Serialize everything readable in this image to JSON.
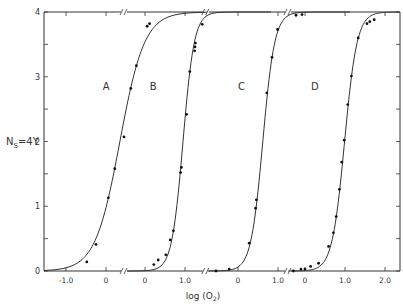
{
  "chart_data": {
    "type": "scatter",
    "title": "",
    "xlabel": "log (O2)",
    "ylabel": "Ns=4Y",
    "ylim": [
      0,
      4
    ],
    "yticks": [
      0,
      1,
      2,
      3,
      4
    ],
    "grid": false,
    "legend": "curve letters annotated on plot",
    "axis_breaks": true,
    "panels": [
      {
        "name": "A",
        "x_zero_px": 106,
        "xticks": [
          -1.0,
          0
        ],
        "xtick_labels": [
          "-1.0",
          "0"
        ],
        "x_start": -1.55,
        "break_after": 0.45,
        "label_pos": [
          0.42,
          2.8
        ],
        "fit": {
          "log_p50": 0.347,
          "n": 1.41
        }
      },
      {
        "name": "B",
        "x_zero_px": 145,
        "xticks": [
          0,
          1.0
        ],
        "xtick_labels": [
          "0",
          "1.0"
        ],
        "x_start": -0.45,
        "break_after": 1.52,
        "label_pos": [
          0.62,
          2.8
        ],
        "fit": {
          "log_p50": 0.95,
          "n": 3.08
        }
      },
      {
        "name": "C",
        "x_zero_px": 238,
        "xticks": [
          0,
          1.0
        ],
        "xtick_labels": [
          "0",
          "1.0"
        ],
        "x_start": -0.75,
        "break_after": 1.25,
        "label_pos": [
          0.5,
          2.8
        ],
        "fit": {
          "log_p50": 0.62,
          "n": 2.92
        }
      },
      {
        "name": "D",
        "x_zero_px": 305,
        "xticks": [
          0,
          1.0,
          2.0
        ],
        "xtick_labels": [
          "0",
          "1.0",
          "2.0"
        ],
        "x_start": -0.42,
        "break_after": 2.4,
        "label_pos": [
          0.65,
          2.8
        ],
        "fit": {
          "log_p50": 0.99,
          "n": 2.78
        }
      }
    ],
    "series": [
      {
        "name": "A",
        "points": [
          [
            -0.48,
            0.14
          ],
          [
            -0.25,
            0.41
          ],
          [
            0.06,
            1.13
          ],
          [
            0.22,
            1.58
          ],
          [
            0.45,
            2.07
          ],
          [
            0.62,
            2.82
          ],
          [
            0.76,
            3.17
          ],
          [
            1.03,
            3.78
          ],
          [
            1.09,
            3.82
          ]
        ]
      },
      {
        "name": "B",
        "points": [
          [
            0.22,
            0.1
          ],
          [
            0.33,
            0.17
          ],
          [
            0.52,
            0.25
          ],
          [
            0.63,
            0.48
          ],
          [
            0.71,
            0.62
          ],
          [
            0.89,
            1.52
          ],
          [
            0.91,
            1.6
          ],
          [
            1.04,
            2.42
          ],
          [
            1.12,
            3.08
          ],
          [
            1.24,
            3.4
          ],
          [
            1.25,
            3.46
          ],
          [
            1.26,
            3.52
          ],
          [
            1.43,
            3.81
          ]
        ]
      },
      {
        "name": "C",
        "points": [
          [
            -0.55,
            0.0
          ],
          [
            -0.22,
            0.03
          ],
          [
            0.28,
            0.43
          ],
          [
            0.44,
            0.97
          ],
          [
            0.46,
            1.1
          ],
          [
            0.72,
            2.75
          ],
          [
            0.85,
            3.3
          ],
          [
            0.99,
            3.73
          ],
          [
            1.45,
            3.95
          ],
          [
            1.6,
            3.96
          ]
        ]
      },
      {
        "name": "D",
        "points": [
          [
            -0.29,
            0.0
          ],
          [
            -0.1,
            0.03
          ],
          [
            0.0,
            0.03
          ],
          [
            0.14,
            0.07
          ],
          [
            0.34,
            0.12
          ],
          [
            0.59,
            0.38
          ],
          [
            0.71,
            0.59
          ],
          [
            0.78,
            0.84
          ],
          [
            0.86,
            1.26
          ],
          [
            0.92,
            1.68
          ],
          [
            0.98,
            2.02
          ],
          [
            1.07,
            2.57
          ],
          [
            1.16,
            3.01
          ],
          [
            1.33,
            3.6
          ],
          [
            1.55,
            3.82
          ],
          [
            1.62,
            3.85
          ],
          [
            1.73,
            3.88
          ]
        ]
      }
    ]
  },
  "labels": {
    "ylabel_main": "N",
    "ylabel_sub": "S",
    "ylabel_rest": "=4Y",
    "xlabel_main": "log (O",
    "xlabel_sub": "2",
    "xlabel_rest": ")"
  },
  "colors": {
    "ink": "#333333",
    "background": "#ffffff"
  }
}
